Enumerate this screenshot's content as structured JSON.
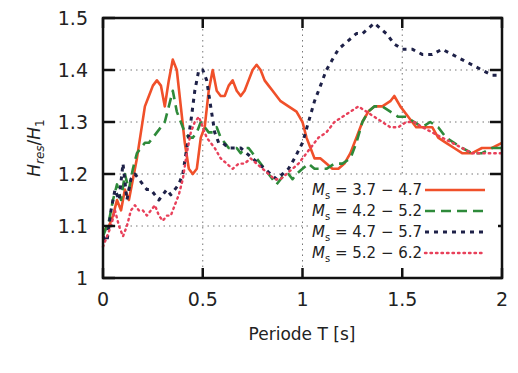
{
  "chart_data": {
    "type": "line",
    "title": "",
    "xlabel": "Periode T [s]",
    "ylabel": "H_res / H_1",
    "ylabel_parts": {
      "main": "H",
      "sub1": "res",
      "sep": "/",
      "main2": "H",
      "sub2": "1"
    },
    "xlim": [
      0,
      2
    ],
    "ylim": [
      1,
      1.5
    ],
    "x_ticks": [
      0,
      0.5,
      1,
      1.5,
      2
    ],
    "x_tick_labels": [
      "0",
      "0.5",
      "1",
      "1.5",
      "2"
    ],
    "y_ticks": [
      1,
      1.1,
      1.2,
      1.3,
      1.4,
      1.5
    ],
    "y_tick_labels": [
      "1",
      "1.1",
      "1.2",
      "1.3",
      "1.4",
      "1.5"
    ],
    "grid": "dotted",
    "legend_position": "lower right",
    "series": [
      {
        "name": "M_s = 3.7 - 4.7",
        "label_sub": "s",
        "label_range": "= 3.7 − 4.7",
        "color": "#f0502a",
        "style": "solid",
        "points": [
          [
            0.0,
            1.09
          ],
          [
            0.03,
            1.1
          ],
          [
            0.05,
            1.12
          ],
          [
            0.07,
            1.15
          ],
          [
            0.09,
            1.13
          ],
          [
            0.11,
            1.17
          ],
          [
            0.13,
            1.15
          ],
          [
            0.15,
            1.19
          ],
          [
            0.17,
            1.23
          ],
          [
            0.19,
            1.28
          ],
          [
            0.21,
            1.33
          ],
          [
            0.23,
            1.35
          ],
          [
            0.25,
            1.37
          ],
          [
            0.27,
            1.38
          ],
          [
            0.29,
            1.37
          ],
          [
            0.31,
            1.33
          ],
          [
            0.33,
            1.38
          ],
          [
            0.35,
            1.42
          ],
          [
            0.37,
            1.4
          ],
          [
            0.39,
            1.33
          ],
          [
            0.41,
            1.26
          ],
          [
            0.43,
            1.21
          ],
          [
            0.45,
            1.2
          ],
          [
            0.47,
            1.21
          ],
          [
            0.49,
            1.27
          ],
          [
            0.51,
            1.29
          ],
          [
            0.53,
            1.36
          ],
          [
            0.55,
            1.4
          ],
          [
            0.57,
            1.36
          ],
          [
            0.59,
            1.35
          ],
          [
            0.61,
            1.35
          ],
          [
            0.63,
            1.37
          ],
          [
            0.65,
            1.38
          ],
          [
            0.67,
            1.36
          ],
          [
            0.69,
            1.35
          ],
          [
            0.71,
            1.36
          ],
          [
            0.73,
            1.38
          ],
          [
            0.75,
            1.4
          ],
          [
            0.77,
            1.41
          ],
          [
            0.79,
            1.4
          ],
          [
            0.81,
            1.38
          ],
          [
            0.83,
            1.37
          ],
          [
            0.85,
            1.36
          ],
          [
            0.87,
            1.35
          ],
          [
            0.89,
            1.34
          ],
          [
            0.93,
            1.33
          ],
          [
            0.97,
            1.32
          ],
          [
            1.0,
            1.3
          ],
          [
            1.02,
            1.27
          ],
          [
            1.04,
            1.25
          ],
          [
            1.06,
            1.23
          ],
          [
            1.09,
            1.23
          ],
          [
            1.12,
            1.22
          ],
          [
            1.15,
            1.21
          ],
          [
            1.18,
            1.21
          ],
          [
            1.21,
            1.22
          ],
          [
            1.24,
            1.24
          ],
          [
            1.27,
            1.27
          ],
          [
            1.3,
            1.3
          ],
          [
            1.33,
            1.32
          ],
          [
            1.36,
            1.33
          ],
          [
            1.4,
            1.33
          ],
          [
            1.44,
            1.34
          ],
          [
            1.46,
            1.35
          ],
          [
            1.49,
            1.33
          ],
          [
            1.53,
            1.31
          ],
          [
            1.57,
            1.29
          ],
          [
            1.61,
            1.29
          ],
          [
            1.65,
            1.29
          ],
          [
            1.68,
            1.27
          ],
          [
            1.72,
            1.26
          ],
          [
            1.76,
            1.25
          ],
          [
            1.8,
            1.24
          ],
          [
            1.85,
            1.24
          ],
          [
            1.9,
            1.25
          ],
          [
            1.95,
            1.25
          ],
          [
            2.0,
            1.26
          ]
        ]
      },
      {
        "name": "M_s = 4.2 - 5.2",
        "label_sub": "s",
        "label_range": "= 4.2 − 5.2",
        "color": "#2e8a3a",
        "style": "dashed",
        "points": [
          [
            0.0,
            1.08
          ],
          [
            0.03,
            1.11
          ],
          [
            0.05,
            1.15
          ],
          [
            0.07,
            1.18
          ],
          [
            0.09,
            1.15
          ],
          [
            0.11,
            1.2
          ],
          [
            0.13,
            1.17
          ],
          [
            0.15,
            1.21
          ],
          [
            0.17,
            1.24
          ],
          [
            0.19,
            1.25
          ],
          [
            0.21,
            1.26
          ],
          [
            0.23,
            1.26
          ],
          [
            0.25,
            1.27
          ],
          [
            0.27,
            1.28
          ],
          [
            0.29,
            1.29
          ],
          [
            0.31,
            1.3
          ],
          [
            0.33,
            1.33
          ],
          [
            0.35,
            1.36
          ],
          [
            0.37,
            1.32
          ],
          [
            0.39,
            1.3
          ],
          [
            0.41,
            1.28
          ],
          [
            0.43,
            1.27
          ],
          [
            0.45,
            1.27
          ],
          [
            0.47,
            1.28
          ],
          [
            0.49,
            1.3
          ],
          [
            0.51,
            1.29
          ],
          [
            0.53,
            1.28
          ],
          [
            0.55,
            1.28
          ],
          [
            0.57,
            1.29
          ],
          [
            0.59,
            1.27
          ],
          [
            0.61,
            1.26
          ],
          [
            0.63,
            1.25
          ],
          [
            0.65,
            1.25
          ],
          [
            0.67,
            1.25
          ],
          [
            0.69,
            1.24
          ],
          [
            0.71,
            1.25
          ],
          [
            0.73,
            1.25
          ],
          [
            0.75,
            1.24
          ],
          [
            0.77,
            1.23
          ],
          [
            0.79,
            1.22
          ],
          [
            0.81,
            1.21
          ],
          [
            0.83,
            1.2
          ],
          [
            0.85,
            1.19
          ],
          [
            0.87,
            1.18
          ],
          [
            0.89,
            1.19
          ],
          [
            0.91,
            1.2
          ],
          [
            0.93,
            1.2
          ],
          [
            0.95,
            1.19
          ],
          [
            0.97,
            1.2
          ],
          [
            1.0,
            1.21
          ],
          [
            1.03,
            1.22
          ],
          [
            1.06,
            1.21
          ],
          [
            1.09,
            1.21
          ],
          [
            1.12,
            1.21
          ],
          [
            1.16,
            1.22
          ],
          [
            1.2,
            1.22
          ],
          [
            1.24,
            1.23
          ],
          [
            1.27,
            1.26
          ],
          [
            1.3,
            1.3
          ],
          [
            1.33,
            1.32
          ],
          [
            1.36,
            1.33
          ],
          [
            1.4,
            1.33
          ],
          [
            1.44,
            1.32
          ],
          [
            1.48,
            1.31
          ],
          [
            1.52,
            1.31
          ],
          [
            1.56,
            1.3
          ],
          [
            1.6,
            1.29
          ],
          [
            1.64,
            1.3
          ],
          [
            1.68,
            1.29
          ],
          [
            1.72,
            1.27
          ],
          [
            1.76,
            1.26
          ],
          [
            1.8,
            1.25
          ],
          [
            1.85,
            1.24
          ],
          [
            1.9,
            1.24
          ],
          [
            1.95,
            1.25
          ],
          [
            2.0,
            1.25
          ]
        ]
      },
      {
        "name": "M_s = 4.7 - 5.7",
        "label_sub": "s",
        "label_range": "= 4.7 − 5.7",
        "color": "#1e2148",
        "style": "dotted-dash",
        "points": [
          [
            0.0,
            1.08
          ],
          [
            0.02,
            1.07
          ],
          [
            0.04,
            1.13
          ],
          [
            0.06,
            1.17
          ],
          [
            0.08,
            1.15
          ],
          [
            0.1,
            1.22
          ],
          [
            0.12,
            1.15
          ],
          [
            0.14,
            1.19
          ],
          [
            0.16,
            1.2
          ],
          [
            0.18,
            1.19
          ],
          [
            0.2,
            1.18
          ],
          [
            0.22,
            1.17
          ],
          [
            0.24,
            1.17
          ],
          [
            0.26,
            1.16
          ],
          [
            0.28,
            1.15
          ],
          [
            0.3,
            1.16
          ],
          [
            0.32,
            1.17
          ],
          [
            0.34,
            1.16
          ],
          [
            0.36,
            1.17
          ],
          [
            0.38,
            1.18
          ],
          [
            0.4,
            1.2
          ],
          [
            0.42,
            1.25
          ],
          [
            0.44,
            1.3
          ],
          [
            0.46,
            1.36
          ],
          [
            0.48,
            1.4
          ],
          [
            0.5,
            1.4
          ],
          [
            0.52,
            1.38
          ],
          [
            0.54,
            1.33
          ],
          [
            0.56,
            1.28
          ],
          [
            0.58,
            1.26
          ],
          [
            0.6,
            1.26
          ],
          [
            0.63,
            1.25
          ],
          [
            0.66,
            1.25
          ],
          [
            0.69,
            1.25
          ],
          [
            0.72,
            1.24
          ],
          [
            0.75,
            1.23
          ],
          [
            0.78,
            1.22
          ],
          [
            0.81,
            1.21
          ],
          [
            0.84,
            1.2
          ],
          [
            0.87,
            1.19
          ],
          [
            0.9,
            1.2
          ],
          [
            0.93,
            1.21
          ],
          [
            0.96,
            1.23
          ],
          [
            1.0,
            1.26
          ],
          [
            1.03,
            1.3
          ],
          [
            1.06,
            1.34
          ],
          [
            1.09,
            1.37
          ],
          [
            1.12,
            1.4
          ],
          [
            1.15,
            1.42
          ],
          [
            1.18,
            1.44
          ],
          [
            1.21,
            1.45
          ],
          [
            1.24,
            1.46
          ],
          [
            1.27,
            1.47
          ],
          [
            1.3,
            1.47
          ],
          [
            1.33,
            1.48
          ],
          [
            1.36,
            1.49
          ],
          [
            1.39,
            1.48
          ],
          [
            1.42,
            1.47
          ],
          [
            1.46,
            1.45
          ],
          [
            1.5,
            1.44
          ],
          [
            1.55,
            1.44
          ],
          [
            1.6,
            1.43
          ],
          [
            1.65,
            1.43
          ],
          [
            1.7,
            1.44
          ],
          [
            1.75,
            1.43
          ],
          [
            1.8,
            1.42
          ],
          [
            1.85,
            1.41
          ],
          [
            1.9,
            1.4
          ],
          [
            1.95,
            1.39
          ],
          [
            2.0,
            1.39
          ]
        ]
      },
      {
        "name": "M_s = 5.2 - 6.2",
        "label_sub": "s",
        "label_range": "= 5.2 − 6.2",
        "color": "#e8405a",
        "style": "dotted",
        "points": [
          [
            0.0,
            1.06
          ],
          [
            0.02,
            1.08
          ],
          [
            0.04,
            1.1
          ],
          [
            0.06,
            1.13
          ],
          [
            0.08,
            1.1
          ],
          [
            0.1,
            1.08
          ],
          [
            0.12,
            1.1
          ],
          [
            0.14,
            1.13
          ],
          [
            0.16,
            1.14
          ],
          [
            0.18,
            1.13
          ],
          [
            0.2,
            1.13
          ],
          [
            0.22,
            1.12
          ],
          [
            0.24,
            1.13
          ],
          [
            0.26,
            1.14
          ],
          [
            0.28,
            1.12
          ],
          [
            0.3,
            1.11
          ],
          [
            0.32,
            1.12
          ],
          [
            0.34,
            1.12
          ],
          [
            0.36,
            1.14
          ],
          [
            0.38,
            1.16
          ],
          [
            0.4,
            1.19
          ],
          [
            0.42,
            1.24
          ],
          [
            0.44,
            1.28
          ],
          [
            0.46,
            1.3
          ],
          [
            0.48,
            1.31
          ],
          [
            0.5,
            1.29
          ],
          [
            0.52,
            1.27
          ],
          [
            0.54,
            1.26
          ],
          [
            0.56,
            1.25
          ],
          [
            0.59,
            1.23
          ],
          [
            0.62,
            1.22
          ],
          [
            0.65,
            1.21
          ],
          [
            0.68,
            1.22
          ],
          [
            0.71,
            1.22
          ],
          [
            0.74,
            1.23
          ],
          [
            0.77,
            1.22
          ],
          [
            0.8,
            1.21
          ],
          [
            0.83,
            1.2
          ],
          [
            0.86,
            1.19
          ],
          [
            0.89,
            1.19
          ],
          [
            0.92,
            1.2
          ],
          [
            0.95,
            1.21
          ],
          [
            0.98,
            1.22
          ],
          [
            1.0,
            1.23
          ],
          [
            1.04,
            1.25
          ],
          [
            1.08,
            1.27
          ],
          [
            1.12,
            1.28
          ],
          [
            1.16,
            1.3
          ],
          [
            1.2,
            1.31
          ],
          [
            1.24,
            1.32
          ],
          [
            1.28,
            1.33
          ],
          [
            1.32,
            1.32
          ],
          [
            1.36,
            1.31
          ],
          [
            1.4,
            1.3
          ],
          [
            1.44,
            1.29
          ],
          [
            1.48,
            1.29
          ],
          [
            1.52,
            1.3
          ],
          [
            1.56,
            1.3
          ],
          [
            1.6,
            1.29
          ],
          [
            1.65,
            1.28
          ],
          [
            1.7,
            1.27
          ],
          [
            1.75,
            1.26
          ],
          [
            1.8,
            1.25
          ],
          [
            1.85,
            1.24
          ],
          [
            1.9,
            1.24
          ],
          [
            1.95,
            1.24
          ],
          [
            2.0,
            1.24
          ]
        ]
      }
    ]
  }
}
